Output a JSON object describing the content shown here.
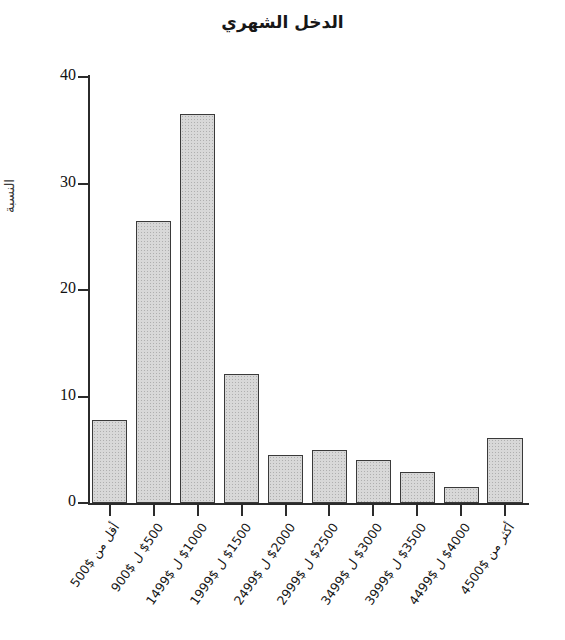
{
  "chart_data": {
    "type": "bar",
    "title": "الدخل الشهري",
    "xlabel": "",
    "ylabel": "النسبة",
    "categories": [
      "أقل من $500",
      "$500 ل $900",
      "$1000 ل $1499",
      "$1500 ل $1999",
      "$2000 ل $2499",
      "$2500 ل $2999",
      "$3000 ل $3499",
      "$3500 ل $3999",
      "$4000 ل $4499",
      "أكثر من $4500"
    ],
    "values": [
      7.8,
      26.5,
      36.5,
      12.1,
      4.5,
      5.0,
      4.0,
      2.9,
      1.5,
      6.1
    ],
    "ylim": [
      0,
      40
    ],
    "yticks": [
      0,
      10,
      20,
      30,
      40
    ],
    "ytick_labels": [
      "0",
      "10",
      "20",
      "30",
      "40"
    ],
    "grid": false,
    "legend": "none",
    "bar_fill_color": "#d8d8d8",
    "bar_border_color": "#3a3a3a",
    "axis_color": "#2b2b2b",
    "background_color": "#ffffff"
  }
}
